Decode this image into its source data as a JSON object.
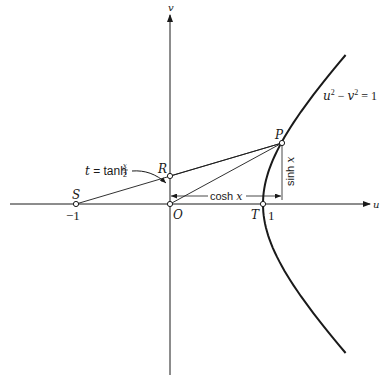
{
  "axes": {
    "u_label": "u",
    "v_label": "v"
  },
  "points": {
    "O": "O",
    "S": "S",
    "R": "R",
    "P": "P",
    "T": "T"
  },
  "ticks": {
    "minus_one": "−1",
    "one": "1"
  },
  "curve": {
    "equation_lhs_u": "u",
    "equation_sup1": "2",
    "equation_minus": " − ",
    "equation_v": "v",
    "equation_sup2": "2",
    "equation_rhs": " = 1"
  },
  "annotations": {
    "t_label_t": "t",
    "t_label_eq": " = tanh ",
    "t_frac_num": "x",
    "t_frac_den": "2",
    "cosh_label_fn": "cosh ",
    "cosh_label_var": "x",
    "sinh_label_fn": "sinh ",
    "sinh_label_var": "x"
  },
  "colors": {
    "ink": "#1a1a1a",
    "background": "#ffffff"
  }
}
